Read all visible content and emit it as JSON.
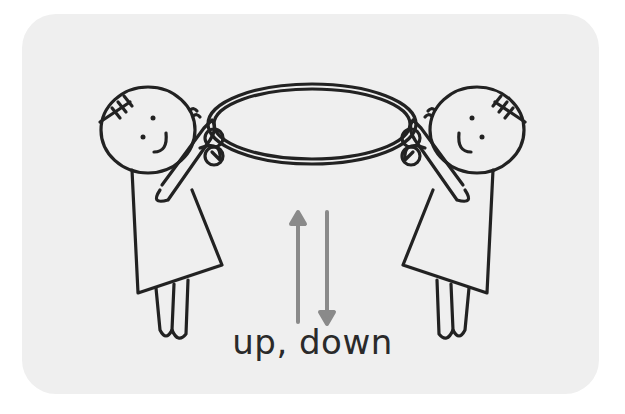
{
  "card": {
    "background": "#efefef",
    "caption": "up, down"
  },
  "illustration": {
    "subject": "two children holding a hoop",
    "line_color": "#222222",
    "arrow_color": "#8a8a8a",
    "arrows": [
      {
        "direction": "up",
        "icon": "arrow-up-icon"
      },
      {
        "direction": "down",
        "icon": "arrow-down-icon"
      }
    ]
  }
}
